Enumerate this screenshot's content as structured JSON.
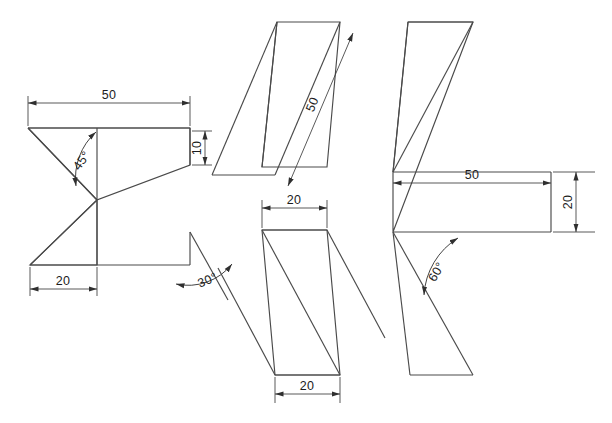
{
  "document": {
    "title": "Sheet Metal Bend Profiles",
    "background_color": "#ffffff",
    "line_color": "#4a4a4a",
    "dimension_color": "#2f2f2f",
    "text_color": "#1c1c1c"
  },
  "figures": [
    {
      "id": "figure-zigzag-left",
      "name": "zigzag-profile",
      "dimensions": [
        {
          "id": "dim-50-top",
          "label": "50",
          "orientation": "horizontal"
        },
        {
          "id": "dim-10-right",
          "label": "10",
          "orientation": "vertical"
        },
        {
          "id": "dim-20-bottom",
          "label": "20",
          "orientation": "horizontal"
        },
        {
          "id": "angle-45",
          "label": "45°",
          "orientation": "angular"
        },
        {
          "id": "angle-30",
          "label": "30°",
          "orientation": "angular"
        }
      ]
    },
    {
      "id": "figure-parallelogram-top-middle",
      "name": "slanted-strip-upper",
      "dimensions": [
        {
          "id": "dim-50-diagonal",
          "label": "50",
          "orientation": "diagonal"
        }
      ]
    },
    {
      "id": "figure-bracket-right",
      "name": "angled-bracket",
      "dimensions": [
        {
          "id": "dim-50-horizontal",
          "label": "50",
          "orientation": "horizontal"
        },
        {
          "id": "dim-20-vertical",
          "label": "20",
          "orientation": "vertical"
        },
        {
          "id": "angle-60",
          "label": "60°",
          "orientation": "angular"
        }
      ]
    },
    {
      "id": "figure-parallelogram-bottom-middle",
      "name": "slanted-strip-lower",
      "dimensions": [
        {
          "id": "dim-20-top",
          "label": "20",
          "orientation": "horizontal"
        },
        {
          "id": "dim-20-bottom-2",
          "label": "20",
          "orientation": "horizontal"
        }
      ]
    }
  ],
  "labels": {
    "left_top_50": "50",
    "left_right_10": "10",
    "left_bottom_20": "20",
    "left_angle_45": "45°",
    "left_angle_30": "30°",
    "mid_top_50": "50",
    "right_50": "50",
    "right_20": "20",
    "right_angle_60": "60°",
    "mid_bottom_top_20": "20",
    "mid_bottom_bottom_20": "20"
  }
}
